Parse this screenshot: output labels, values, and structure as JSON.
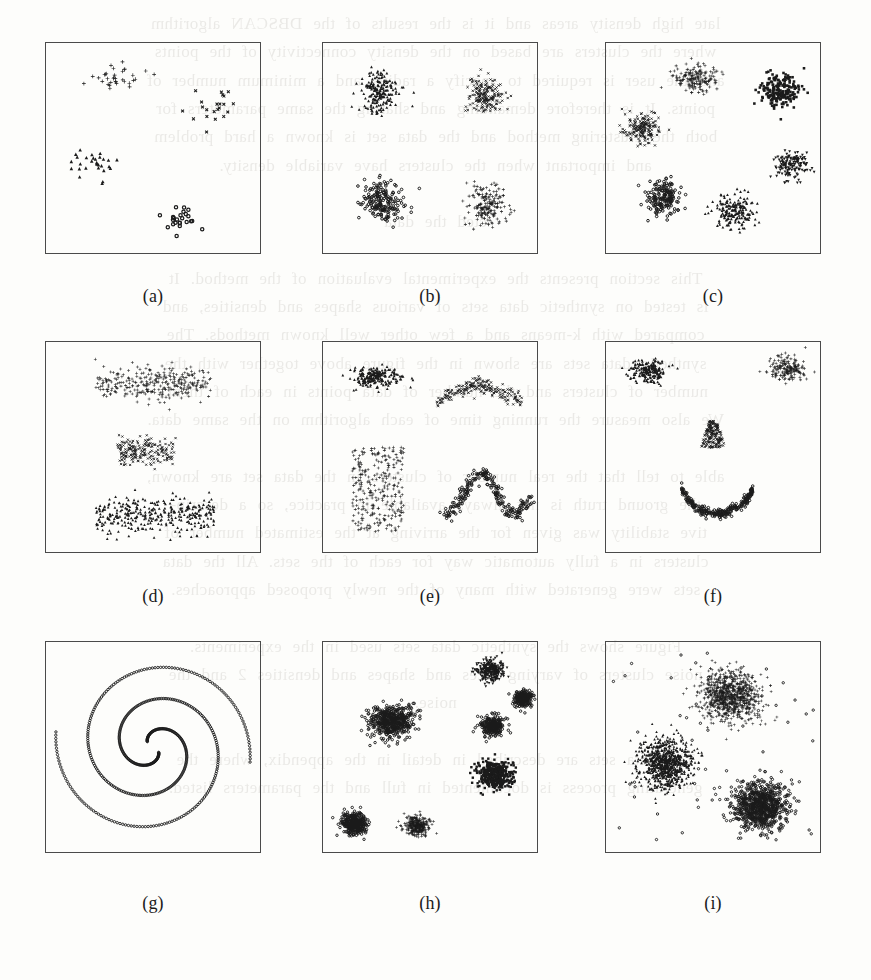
{
  "document": {
    "kind": "scanned-journal-page-figure",
    "page_background": "#fdfdfb",
    "ink_color": "#1b1b1b",
    "frame_color": "#4a4a4a"
  },
  "bleed_through_text": {
    "note": "faint mirrored show-through of text printed on the reverse side of the scanned page",
    "lines": [
      "late high density areas and it is the results of the DBSCAN algorithm",
      "where the clusters are based on the  density connectivity of the points",
      "and the user is  required to specify  a radius and a minimum number of",
      "points. It is therefore demanding  and sharing the same parameters for",
      "both the clustering method and the data  set is known a hard problem",
      "and important when the clusters have variable density.",
      "",
      "cted the data",
      "",
      "This  section  presents  the  experimental  evaluation  of  the  method.  It",
      "is tested  on synthetic  data  sets  of  various  shapes  and  densities,  and",
      "compared  with  k-means  and  a  few  other  well  known  methods.  The",
      "synthetic data sets  are shown  in  the  figure  above  together  with  the",
      "number of clusters  and  the  number  of  data  points  in  each  of  them.",
      "We also measure the running time of each algorithm on the same data.",
      "",
      "able to tell that the real number of clusters in the  data  set  are  known,",
      "the  ground  truth  is  not  always  available  in  practice,  so  a  descrip-",
      "tive  stability  was  given  for  the  arriving  at  the  estimated  number of",
      "clusters  in  a  fully  automatic  way  for  each  of  the  sets.  All  the  data",
      "sets  were  generated  with  many  of  the  newly  proposed  approaches.",
      "",
      "Figure  shows  the  synthetic  data  sets  used  in  the  experiments.",
      "noise  clusters  of  varying  sizes  and  shapes  and  densities 2  and  the",
      "noise.",
      "",
      "The  data  sets  are  described  in  detail  in  the  appendix,  where  the",
      "generating  process  is  documented  in  full  and  the  parameters  listed."
    ]
  },
  "figure": {
    "layout": {
      "rows": 3,
      "cols": 3
    },
    "panels": [
      {
        "id": "a",
        "caption": "(a)",
        "description": "four sparse well-separated clusters with distinct markers",
        "n_clusters": 4,
        "density": "sparse",
        "clusters": [
          {
            "marker": "plus",
            "shape": "gaussian",
            "cx": 0.34,
            "cy": 0.16,
            "sx": 0.115,
            "sy": 0.055,
            "n": 34
          },
          {
            "marker": "x",
            "shape": "gaussian",
            "cx": 0.78,
            "cy": 0.3,
            "sx": 0.105,
            "sy": 0.075,
            "n": 22
          },
          {
            "marker": "triangle",
            "shape": "gaussian",
            "cx": 0.22,
            "cy": 0.58,
            "sx": 0.105,
            "sy": 0.07,
            "n": 30
          },
          {
            "marker": "circle",
            "shape": "gaussian",
            "cx": 0.63,
            "cy": 0.85,
            "sx": 0.08,
            "sy": 0.055,
            "n": 24
          }
        ]
      },
      {
        "id": "b",
        "caption": "(b)",
        "description": "four dense gaussian clusters in a two by two arrangement",
        "n_clusters": 4,
        "density": "dense",
        "clusters": [
          {
            "marker": "triangle",
            "shape": "gaussian",
            "cx": 0.27,
            "cy": 0.24,
            "sx": 0.085,
            "sy": 0.085,
            "n": 190
          },
          {
            "marker": "x",
            "shape": "gaussian",
            "cx": 0.76,
            "cy": 0.25,
            "sx": 0.075,
            "sy": 0.085,
            "n": 175
          },
          {
            "marker": "circle",
            "shape": "gaussian",
            "cx": 0.28,
            "cy": 0.75,
            "sx": 0.085,
            "sy": 0.085,
            "n": 190
          },
          {
            "marker": "plus",
            "shape": "gaussian",
            "cx": 0.76,
            "cy": 0.77,
            "sx": 0.08,
            "sy": 0.085,
            "n": 180
          }
        ]
      },
      {
        "id": "c",
        "caption": "(c)",
        "description": "six dense clusters arranged around a ring",
        "n_clusters": 6,
        "density": "dense",
        "clusters": [
          {
            "marker": "plus",
            "shape": "gaussian",
            "cx": 0.42,
            "cy": 0.17,
            "sx": 0.085,
            "sy": 0.06,
            "n": 165
          },
          {
            "marker": "square",
            "shape": "gaussian",
            "cx": 0.81,
            "cy": 0.23,
            "sx": 0.08,
            "sy": 0.075,
            "n": 200
          },
          {
            "marker": "x",
            "shape": "gaussian",
            "cx": 0.17,
            "cy": 0.41,
            "sx": 0.08,
            "sy": 0.065,
            "n": 170
          },
          {
            "marker": "down-tri",
            "shape": "gaussian",
            "cx": 0.86,
            "cy": 0.58,
            "sx": 0.07,
            "sy": 0.06,
            "n": 150
          },
          {
            "marker": "circle",
            "shape": "gaussian",
            "cx": 0.27,
            "cy": 0.73,
            "sx": 0.075,
            "sy": 0.07,
            "n": 175
          },
          {
            "marker": "triangle",
            "shape": "gaussian",
            "cx": 0.6,
            "cy": 0.8,
            "sx": 0.085,
            "sy": 0.075,
            "n": 180
          }
        ]
      },
      {
        "id": "d",
        "caption": "(d)",
        "description": "three elongated horizontal band clusters of differing width",
        "n_clusters": 3,
        "density": "medium",
        "clusters": [
          {
            "marker": "plus",
            "shape": "band",
            "cx": 0.5,
            "cy": 0.2,
            "sx": 0.27,
            "sy": 0.075,
            "n": 300
          },
          {
            "marker": "x",
            "shape": "band",
            "cx": 0.47,
            "cy": 0.52,
            "sx": 0.135,
            "sy": 0.065,
            "n": 190
          },
          {
            "marker": "triangle",
            "shape": "band",
            "cx": 0.51,
            "cy": 0.82,
            "sx": 0.275,
            "sy": 0.08,
            "n": 330
          }
        ]
      },
      {
        "id": "e",
        "caption": "(e)",
        "description": "four clusters of differing geometry: blob, arch, rectangle and sine wave",
        "n_clusters": 4,
        "density": "medium",
        "clusters": [
          {
            "marker": "triangle",
            "shape": "gaussian",
            "cx": 0.25,
            "cy": 0.17,
            "sx": 0.105,
            "sy": 0.045,
            "n": 220
          },
          {
            "marker": "x",
            "shape": "arch",
            "cx": 0.73,
            "cy": 0.2,
            "sx": 0.2,
            "sy": 0.085,
            "n": 200
          },
          {
            "marker": "plus",
            "shape": "rectangle",
            "cx": 0.26,
            "cy": 0.7,
            "sx": 0.12,
            "sy": 0.2,
            "n": 280
          },
          {
            "marker": "circle",
            "shape": "sine",
            "cx": 0.76,
            "cy": 0.72,
            "sx": 0.2,
            "sy": 0.15,
            "n": 230
          }
        ]
      },
      {
        "id": "f",
        "caption": "(f)",
        "description": "smiley face shaped data: two eyes, a nose and a smiling arc",
        "n_clusters": 4,
        "density": "medium",
        "clusters": [
          {
            "marker": "triangle",
            "shape": "gaussian",
            "cx": 0.2,
            "cy": 0.14,
            "sx": 0.075,
            "sy": 0.05,
            "n": 190
          },
          {
            "marker": "plus",
            "shape": "gaussian",
            "cx": 0.84,
            "cy": 0.13,
            "sx": 0.07,
            "sy": 0.05,
            "n": 180
          },
          {
            "marker": "x",
            "shape": "nose",
            "cx": 0.5,
            "cy": 0.44,
            "sx": 0.06,
            "sy": 0.13,
            "n": 170
          },
          {
            "marker": "circle",
            "shape": "smile",
            "cx": 0.52,
            "cy": 0.62,
            "sx": 0.36,
            "sy": 0.27,
            "n": 260
          }
        ]
      },
      {
        "id": "g",
        "caption": "(g)",
        "description": "two interleaved spiral arms traced with small circle markers",
        "n_clusters": 2,
        "density": "curve",
        "clusters": [
          {
            "marker": "circle",
            "shape": "spiral",
            "cx": 0.5,
            "cy": 0.5,
            "sx": 0.455,
            "sy": 0.455,
            "n": 260,
            "phase": 0
          },
          {
            "marker": "circle",
            "shape": "spiral",
            "cx": 0.5,
            "cy": 0.5,
            "sx": 0.455,
            "sy": 0.455,
            "n": 260,
            "phase": 3.14159
          }
        ]
      },
      {
        "id": "h",
        "caption": "(h)",
        "description": "seven very dense blobs of unequal size and spread",
        "n_clusters": 7,
        "density": "very-dense",
        "clusters": [
          {
            "marker": "circle",
            "shape": "gaussian",
            "cx": 0.32,
            "cy": 0.38,
            "sx": 0.095,
            "sy": 0.07,
            "n": 500
          },
          {
            "marker": "down-tri",
            "shape": "gaussian",
            "cx": 0.78,
            "cy": 0.14,
            "sx": 0.055,
            "sy": 0.045,
            "n": 300
          },
          {
            "marker": "circle",
            "shape": "gaussian",
            "cx": 0.93,
            "cy": 0.27,
            "sx": 0.04,
            "sy": 0.037,
            "n": 210
          },
          {
            "marker": "circle",
            "shape": "gaussian",
            "cx": 0.79,
            "cy": 0.4,
            "sx": 0.048,
            "sy": 0.042,
            "n": 250
          },
          {
            "marker": "square",
            "shape": "gaussian",
            "cx": 0.8,
            "cy": 0.63,
            "sx": 0.075,
            "sy": 0.06,
            "n": 400
          },
          {
            "marker": "circle",
            "shape": "gaussian",
            "cx": 0.15,
            "cy": 0.86,
            "sx": 0.058,
            "sy": 0.048,
            "n": 330
          },
          {
            "marker": "plus",
            "shape": "gaussian",
            "cx": 0.44,
            "cy": 0.87,
            "sx": 0.052,
            "sy": 0.042,
            "n": 300
          }
        ]
      },
      {
        "id": "i",
        "caption": "(i)",
        "description": "three large very dense clusters embedded in uniform background noise",
        "n_clusters": 3,
        "density": "very-dense-with-noise",
        "clusters": [
          {
            "marker": "plus",
            "shape": "gaussian",
            "cx": 0.58,
            "cy": 0.26,
            "sx": 0.125,
            "sy": 0.11,
            "n": 900
          },
          {
            "marker": "triangle",
            "shape": "gaussian",
            "cx": 0.28,
            "cy": 0.58,
            "sx": 0.11,
            "sy": 0.105,
            "n": 820
          },
          {
            "marker": "circle",
            "shape": "gaussian",
            "cx": 0.72,
            "cy": 0.78,
            "sx": 0.115,
            "sy": 0.1,
            "n": 820
          },
          {
            "marker": "circle",
            "shape": "uniform",
            "cx": 0.5,
            "cy": 0.5,
            "sx": 0.47,
            "sy": 0.47,
            "n": 55
          }
        ]
      }
    ]
  }
}
